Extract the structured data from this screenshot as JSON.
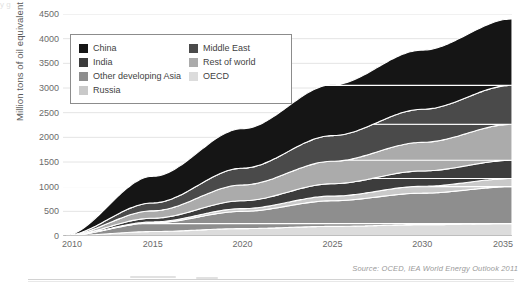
{
  "figure": {
    "source_note": "Source: OCED, IEA World Energy Outlook 2011",
    "top_remnant": "y                                                                                                                         g"
  },
  "legend": {
    "items": [
      {
        "label": "China",
        "color": "#151515",
        "column": "left"
      },
      {
        "label": "Middle East",
        "color": "#4a4a4a",
        "column": "right"
      },
      {
        "label": "India",
        "color": "#3c3c3c",
        "column": "left"
      },
      {
        "label": "Rest of world",
        "color": "#ababab",
        "column": "right"
      },
      {
        "label": "Other developing Asia",
        "color": "#8e8e8e",
        "column": "left"
      },
      {
        "label": "OECD",
        "color": "#dcdcdc",
        "column": "right"
      },
      {
        "label": "Russia",
        "color": "#c9c9c9",
        "column": "left"
      }
    ]
  },
  "chart_data": {
    "type": "area",
    "stacked": true,
    "title": "",
    "xlabel": "",
    "ylabel": "Million tons of oil equivalent",
    "xlim": [
      2010,
      2035
    ],
    "ylim": [
      0,
      4500
    ],
    "ytick_step": 500,
    "grid": true,
    "legend_position": "upper-left-inside",
    "yticks": [
      0,
      500,
      1000,
      1500,
      2000,
      2500,
      3000,
      3500,
      4000,
      4500
    ],
    "ytick_labels": [
      "0",
      "500",
      "1000",
      "1500",
      "2000",
      "2500",
      "3000",
      "3500",
      "4000",
      "4500"
    ],
    "xticks": [
      2010,
      2015,
      2020,
      2025,
      2030,
      2035
    ],
    "xtick_labels": [
      "2010",
      "2015",
      "2020",
      "2025",
      "2030",
      "2035"
    ],
    "x": [
      2010,
      2015,
      2020,
      2025,
      2030,
      2035
    ],
    "stack_order_bottom_to_top": [
      "OECD",
      "Other developing Asia",
      "Russia",
      "India",
      "Rest of world",
      "Middle East",
      "China"
    ],
    "series": [
      {
        "name": "OECD",
        "color": "#dcdcdc",
        "values": [
          0,
          90,
          150,
          195,
          228,
          250
        ]
      },
      {
        "name": "Other developing Asia",
        "color": "#8e8e8e",
        "values": [
          0,
          175,
          350,
          520,
          640,
          750
        ]
      },
      {
        "name": "Russia",
        "color": "#c9c9c9",
        "values": [
          0,
          20,
          55,
          95,
          140,
          165
        ]
      },
      {
        "name": "India",
        "color": "#3c3c3c",
        "values": [
          0,
          75,
          160,
          250,
          310,
          370
        ]
      },
      {
        "name": "Rest of world",
        "color": "#ababab",
        "values": [
          0,
          150,
          320,
          455,
          580,
          730
        ]
      },
      {
        "name": "Middle East",
        "color": "#4a4a4a",
        "values": [
          0,
          160,
          340,
          520,
          670,
          790
        ]
      },
      {
        "name": "China",
        "color": "#151515",
        "values": [
          0,
          540,
          800,
          1030,
          1200,
          1345
        ]
      }
    ],
    "cumulative_totals": [
      0,
      1210,
      2175,
      3065,
      3768,
      4400
    ],
    "total_2035": 4400
  }
}
